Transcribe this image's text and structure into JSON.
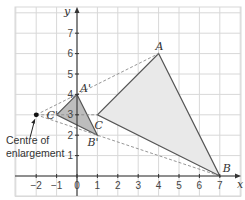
{
  "diagram": {
    "type": "enlargement-on-grid",
    "axes": {
      "x_label": "x",
      "y_label": "y",
      "x_ticks": [
        "-2",
        "-1",
        "0",
        "1",
        "2",
        "3",
        "4",
        "5",
        "6",
        "7"
      ],
      "y_ticks": [
        "1",
        "2",
        "3",
        "4",
        "5",
        "6",
        "7"
      ]
    },
    "points": {
      "A": {
        "label": "A",
        "x": 4,
        "y": 6
      },
      "B": {
        "label": "B",
        "x": 7,
        "y": 0
      },
      "C": {
        "label": "C",
        "x": 1,
        "y": 3
      },
      "A_prime": {
        "label": "A'",
        "x": 0,
        "y": 4
      },
      "B_prime": {
        "label": "B'",
        "x": 1,
        "y": 2
      },
      "C_prime": {
        "label": "C'",
        "x": -1,
        "y": 3
      },
      "centre": {
        "label": "",
        "x": -2,
        "y": 3
      }
    },
    "annotation": {
      "line1": "Centre of",
      "line2": "enlargement"
    },
    "colors": {
      "grid": "#d8d8d8",
      "axis": "#333333",
      "large_fill": "#e9e9e9",
      "small_fill": "#bdbdbd",
      "edge": "#555555",
      "ray": "#8a8a8a"
    }
  }
}
